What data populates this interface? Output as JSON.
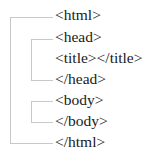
{
  "diagram": {
    "type": "tree",
    "nodes": [
      {
        "label": "<html>",
        "level": 0
      },
      {
        "label": "<head>",
        "level": 1
      },
      {
        "label": "<title></title>",
        "level": 2
      },
      {
        "label": "</head>",
        "level": 1
      },
      {
        "label": "<body>",
        "level": 1
      },
      {
        "label": "</body>",
        "level": 1
      },
      {
        "label": "</html>",
        "level": 0
      }
    ],
    "colors": {
      "line": "#c8c8c8",
      "text": "#1a1a1a"
    }
  }
}
